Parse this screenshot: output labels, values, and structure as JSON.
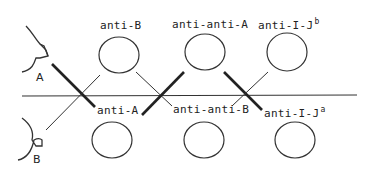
{
  "diagram": {
    "segments": {
      "A": "A",
      "B": "B"
    },
    "top_row": [
      {
        "label": "anti-B",
        "sup": ""
      },
      {
        "label": "anti-anti-A",
        "sup": ""
      },
      {
        "label": "anti-I-J",
        "sup": "b"
      }
    ],
    "bottom_row": [
      {
        "label": "anti-A",
        "sup": ""
      },
      {
        "label": "anti-anti-B",
        "sup": ""
      },
      {
        "label": "anti-I-J",
        "sup": "a"
      }
    ],
    "colors": {
      "line": "#222222",
      "background": "#ffffff"
    }
  }
}
